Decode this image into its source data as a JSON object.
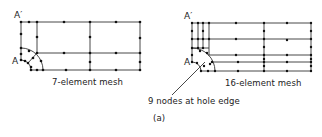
{
  "figure": {
    "panel_label": "(a)",
    "annotation": "9 nodes at hole edge",
    "left_mesh": {
      "caption": "7-element mesh",
      "point_top": "A′",
      "point_hole": "A"
    },
    "right_mesh": {
      "caption": "16-element mesh",
      "point_top": "A′",
      "point_hole": "A"
    }
  },
  "colors": {
    "ink": "#222222",
    "background": "#ffffff"
  }
}
